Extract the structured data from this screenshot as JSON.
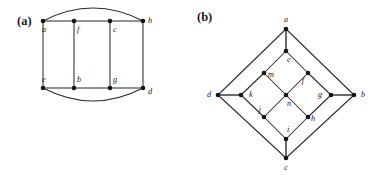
{
  "figure": {
    "type": "graph-diagram-pair",
    "background": "#ffffff",
    "line_color": "#2b2b2b",
    "vertex_color": "#141414",
    "label_color": "#1a1a1a"
  },
  "panels": [
    {
      "id": "a",
      "tag": "(a)",
      "description": "Ladder graph with four top vertices and four bottom vertices plus two outer arcs",
      "vertices": [
        {
          "id": "a",
          "label": "a",
          "x": 43,
          "y": 21,
          "label_dx": -1,
          "label_dy": 9,
          "anchor": "start"
        },
        {
          "id": "f",
          "label": "f",
          "x": 74,
          "y": 21,
          "label_dx": 3,
          "label_dy": 9,
          "anchor": "start"
        },
        {
          "id": "c",
          "label": "c",
          "x": 110,
          "y": 21,
          "label_dx": 3,
          "label_dy": 9,
          "anchor": "start"
        },
        {
          "id": "h",
          "label": "h",
          "x": 143,
          "y": 21,
          "label_dx": 5,
          "label_dy": 0,
          "anchor": "start"
        },
        {
          "id": "e",
          "label": "e",
          "x": 43,
          "y": 88,
          "label_dx": -1,
          "label_dy": -8,
          "anchor": "start"
        },
        {
          "id": "b",
          "label": "b",
          "x": 74,
          "y": 88,
          "label_dx": 3,
          "label_dy": -8,
          "anchor": "start"
        },
        {
          "id": "g",
          "label": "g",
          "x": 110,
          "y": 88,
          "label_dx": 3,
          "label_dy": -8,
          "anchor": "start"
        },
        {
          "id": "d",
          "label": "d",
          "x": 143,
          "y": 88,
          "label_dx": 5,
          "label_dy": 4,
          "anchor": "start"
        }
      ],
      "edges": [
        {
          "from": "a",
          "to": "f",
          "kind": "line"
        },
        {
          "from": "f",
          "to": "c",
          "kind": "line"
        },
        {
          "from": "c",
          "to": "h",
          "kind": "line"
        },
        {
          "from": "e",
          "to": "b",
          "kind": "line"
        },
        {
          "from": "b",
          "to": "g",
          "kind": "line"
        },
        {
          "from": "g",
          "to": "d",
          "kind": "line"
        },
        {
          "from": "a",
          "to": "e",
          "kind": "line"
        },
        {
          "from": "f",
          "to": "b",
          "kind": "line"
        },
        {
          "from": "c",
          "to": "g",
          "kind": "line"
        },
        {
          "from": "h",
          "to": "d",
          "kind": "line"
        },
        {
          "from": "a",
          "to": "h",
          "kind": "arc-above",
          "bulge": 13
        },
        {
          "from": "e",
          "to": "d",
          "kind": "arc-below",
          "bulge": 13
        }
      ]
    },
    {
      "id": "b",
      "tag": "(b)",
      "description": "Nested diamond graph: outer diamond a-b-c-d, middle diamond e-g-i-k, inner diamond m-f-h-j with center n",
      "vertices": [
        {
          "id": "a",
          "label": "a",
          "x": 97,
          "y": 29,
          "label_dx": 0,
          "label_dy": -9,
          "anchor": "middle"
        },
        {
          "id": "b",
          "label": "b",
          "x": 165,
          "y": 95,
          "label_dx": 7,
          "label_dy": 0,
          "anchor": "start"
        },
        {
          "id": "c",
          "label": "c",
          "x": 97,
          "y": 158,
          "label_dx": 0,
          "label_dy": 10,
          "anchor": "middle"
        },
        {
          "id": "d",
          "label": "d",
          "x": 29,
          "y": 95,
          "label_dx": -7,
          "label_dy": 0,
          "anchor": "end"
        },
        {
          "id": "e",
          "label": "e",
          "x": 97,
          "y": 51,
          "label_dx": 1,
          "label_dy": 9,
          "anchor": "start"
        },
        {
          "id": "g",
          "label": "g",
          "x": 142,
          "y": 95,
          "label_dx": -9,
          "label_dy": 0,
          "anchor": "end"
        },
        {
          "id": "i",
          "label": "i",
          "x": 97,
          "y": 139,
          "label_dx": 1,
          "label_dy": -9,
          "anchor": "start"
        },
        {
          "id": "k",
          "label": "k",
          "x": 52,
          "y": 95,
          "label_dx": 8,
          "label_dy": 0,
          "anchor": "start"
        },
        {
          "id": "m",
          "label": "m",
          "x": 75,
          "y": 73,
          "label_dx": 4,
          "label_dy": 2,
          "anchor": "start"
        },
        {
          "id": "f",
          "label": "f",
          "x": 119,
          "y": 73,
          "label_dx": -4,
          "label_dy": 8,
          "anchor": "end"
        },
        {
          "id": "h",
          "label": "h",
          "x": 119,
          "y": 117,
          "label_dx": 3,
          "label_dy": 2,
          "anchor": "start"
        },
        {
          "id": "j",
          "label": "j",
          "x": 75,
          "y": 117,
          "label_dx": -3,
          "label_dy": -7,
          "anchor": "end"
        },
        {
          "id": "n",
          "label": "n",
          "x": 97,
          "y": 95,
          "label_dx": 1,
          "label_dy": 9,
          "anchor": "start"
        }
      ],
      "edges": [
        {
          "from": "a",
          "to": "b",
          "kind": "line"
        },
        {
          "from": "b",
          "to": "c",
          "kind": "line"
        },
        {
          "from": "c",
          "to": "d",
          "kind": "line"
        },
        {
          "from": "d",
          "to": "a",
          "kind": "line"
        },
        {
          "from": "e",
          "to": "f",
          "kind": "line"
        },
        {
          "from": "f",
          "to": "g",
          "kind": "line"
        },
        {
          "from": "g",
          "to": "h",
          "kind": "line"
        },
        {
          "from": "h",
          "to": "i",
          "kind": "line"
        },
        {
          "from": "i",
          "to": "j",
          "kind": "line"
        },
        {
          "from": "j",
          "to": "k",
          "kind": "line"
        },
        {
          "from": "k",
          "to": "m",
          "kind": "line"
        },
        {
          "from": "m",
          "to": "e",
          "kind": "line"
        },
        {
          "from": "a",
          "to": "e",
          "kind": "line-thick"
        },
        {
          "from": "b",
          "to": "g",
          "kind": "line-thick"
        },
        {
          "from": "c",
          "to": "i",
          "kind": "line-thick"
        },
        {
          "from": "d",
          "to": "k",
          "kind": "line-thick"
        },
        {
          "from": "m",
          "to": "n",
          "kind": "line"
        },
        {
          "from": "f",
          "to": "n",
          "kind": "line"
        },
        {
          "from": "h",
          "to": "n",
          "kind": "line"
        },
        {
          "from": "j",
          "to": "n",
          "kind": "line"
        }
      ]
    }
  ]
}
